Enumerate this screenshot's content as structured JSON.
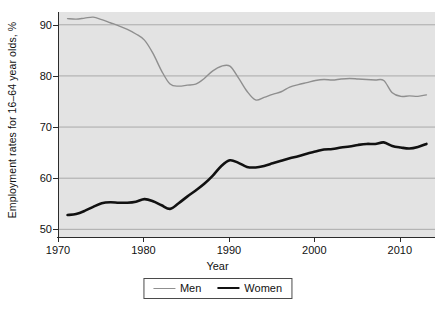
{
  "chart_data": {
    "type": "line",
    "title": "",
    "xlabel": "Year",
    "ylabel": "Employment rates for 16–64 year olds, %",
    "xlim": [
      1970,
      2014
    ],
    "ylim": [
      48.5,
      92.5
    ],
    "xticks": [
      1970,
      1980,
      1990,
      2000,
      2010
    ],
    "xticklabels": [
      "1970",
      "1980",
      "1990",
      "2000",
      "2010"
    ],
    "yticks": [
      50,
      60,
      70,
      80,
      90
    ],
    "yticklabels": [
      "50",
      "60",
      "70",
      "80",
      "90"
    ],
    "grid": "horizontal",
    "legend_position": "below-axes",
    "plot_background": "#e3e3e3",
    "gridline_color": "#9a9a9a",
    "x": [
      1971,
      1972,
      1973,
      1974,
      1975,
      1976,
      1977,
      1978,
      1979,
      1980,
      1981,
      1982,
      1983,
      1984,
      1985,
      1986,
      1987,
      1988,
      1989,
      1990,
      1991,
      1992,
      1993,
      1994,
      1995,
      1996,
      1997,
      1998,
      1999,
      2000,
      2001,
      2002,
      2003,
      2004,
      2005,
      2006,
      2007,
      2008,
      2009,
      2010,
      2011,
      2012,
      2013
    ],
    "series": [
      {
        "name": "Men",
        "color": "#8f8f8f",
        "linewidth": 1.4,
        "values": [
          91.2,
          91.1,
          91.3,
          91.5,
          91.0,
          90.4,
          89.8,
          89.1,
          88.2,
          87.0,
          84.4,
          81.0,
          78.4,
          78.0,
          78.2,
          78.4,
          79.5,
          81.0,
          81.9,
          81.9,
          79.6,
          77.0,
          75.3,
          75.8,
          76.4,
          76.9,
          77.8,
          78.3,
          78.7,
          79.1,
          79.3,
          79.2,
          79.4,
          79.5,
          79.4,
          79.3,
          79.2,
          79.1,
          76.7,
          76.0,
          76.1,
          76.0,
          76.3
        ]
      },
      {
        "name": "Women",
        "color": "#111111",
        "linewidth": 2.6,
        "values": [
          52.8,
          53.0,
          53.6,
          54.4,
          55.1,
          55.3,
          55.2,
          55.2,
          55.4,
          55.9,
          55.5,
          54.7,
          54.0,
          55.1,
          56.4,
          57.6,
          58.9,
          60.5,
          62.4,
          63.5,
          63.0,
          62.2,
          62.1,
          62.4,
          62.9,
          63.4,
          63.9,
          64.3,
          64.8,
          65.2,
          65.6,
          65.7,
          66.0,
          66.2,
          66.5,
          66.7,
          66.7,
          67.0,
          66.3,
          66.0,
          65.8,
          66.1,
          66.7
        ]
      }
    ]
  },
  "legend": {
    "entries": [
      {
        "label": "Men",
        "key": "men"
      },
      {
        "label": "Women",
        "key": "women"
      }
    ]
  }
}
